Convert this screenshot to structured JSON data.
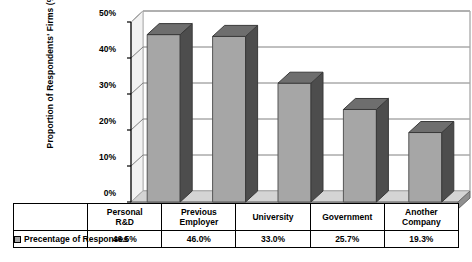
{
  "chart_data": {
    "type": "bar",
    "title": "",
    "subtitle": "",
    "xlabel": "",
    "ylabel": "Proportion of Respondents' Firms (%)",
    "categories": [
      "Personal R&D",
      "Previous Employer",
      "University",
      "Government",
      "Another Company"
    ],
    "category_lines": [
      [
        "Personal",
        "R&D"
      ],
      [
        "Previous",
        "Employer"
      ],
      [
        "University",
        ""
      ],
      [
        "Government",
        ""
      ],
      [
        "Another",
        "Company"
      ]
    ],
    "values": [
      46.5,
      46.0,
      33.0,
      25.7,
      19.3
    ],
    "value_labels": [
      "46.5%",
      "46.0%",
      "33.0%",
      "25.7%",
      "19.3%"
    ],
    "series": [
      {
        "name": "Precentage of Responses",
        "values": [
          46.5,
          46.0,
          33.0,
          25.7,
          19.3
        ]
      }
    ],
    "ylim": [
      0,
      50
    ],
    "ytick_values": [
      0,
      10,
      20,
      30,
      40,
      50
    ],
    "ytick_labels": [
      "0%",
      "10%",
      "20%",
      "30%",
      "40%",
      "50%"
    ],
    "grid": true,
    "grid_axis": "y",
    "legend_position": "bottom-table",
    "three_d": true,
    "colors": {
      "bar_front": "#a6a6a6",
      "bar_side": "#4d4d4d",
      "bar_top": "#6e6e6e",
      "floor_front": "#a6a6a6",
      "floor_top": "#d4d4d4",
      "wall_face": "#f2f2f2",
      "wall_side": "#e8e8e8",
      "grid_line": "#808080",
      "frame_line": "#b3b3b3",
      "axis_line": "#000000",
      "text": "#000000",
      "background": "#ffffff"
    }
  },
  "legend": {
    "swatch_name": "series-color-swatch",
    "label": "Precentage of Responses"
  },
  "table": {
    "row_label": "Precentage of Responses",
    "headers": [
      "Personal R&D",
      "Previous Employer",
      "University",
      "Government",
      "Another Company"
    ],
    "values": [
      "46.5%",
      "46.0%",
      "33.0%",
      "25.7%",
      "19.3%"
    ]
  },
  "axis": {
    "y_title": "Proportion of Respondents' Firms (%)",
    "y_ticks": [
      "50%",
      "40%",
      "30%",
      "20%",
      "10%",
      "0%"
    ]
  }
}
